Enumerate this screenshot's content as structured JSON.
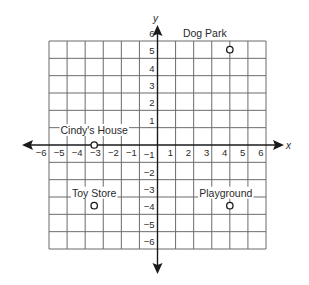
{
  "chart_data": {
    "type": "scatter",
    "title": "",
    "xlabel": "x",
    "ylabel": "y",
    "xlim": [
      -6,
      6
    ],
    "ylim": [
      -6,
      6
    ],
    "grid": true,
    "x_ticks": [
      -6,
      -5,
      -4,
      -3,
      -2,
      -1,
      1,
      2,
      3,
      4,
      5,
      6
    ],
    "y_ticks": [
      6,
      5,
      4,
      3,
      2,
      1,
      -1,
      -2,
      -3,
      -4,
      -5,
      -6
    ],
    "tick_labels_x": [
      "−6",
      "−5",
      "−4",
      "−3",
      "−2",
      "−1",
      "1",
      "2",
      "3",
      "4",
      "5",
      "6"
    ],
    "tick_labels_y": [
      "6",
      "5",
      "4",
      "3",
      "2",
      "1",
      "−1",
      "−2",
      "−3",
      "−4",
      "−5",
      "−6"
    ],
    "points": [
      {
        "label": "Dog Park",
        "x": 4,
        "y": 5.5
      },
      {
        "label": "Cindy's House",
        "x": -3.5,
        "y": 0
      },
      {
        "label": "Toy Store",
        "x": -3.5,
        "y": -3.5
      },
      {
        "label": "Playground",
        "x": 4,
        "y": -3.5
      }
    ]
  },
  "axes": {
    "x_title": "x",
    "y_title": "y"
  },
  "labels": {
    "dog_park": "Dog Park",
    "cindys_house": "Cindy's House",
    "toy_store": "Toy Store",
    "playground": "Playground"
  },
  "colors": {
    "grid": "#6b6b6b",
    "axis": "#1a1a1a",
    "text": "#2a2a2a",
    "background": "#ffffff"
  }
}
